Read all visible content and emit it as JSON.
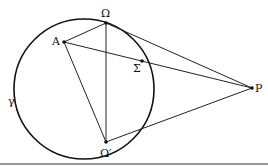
{
  "diagram": {
    "circle": {
      "label": "γ",
      "cx": 84,
      "cy": 89,
      "r": 70
    },
    "points": {
      "A": {
        "label": "A",
        "x": 64,
        "y": 42
      },
      "Omega": {
        "label": "Ω",
        "x": 106,
        "y": 23
      },
      "Sigma": {
        "label": "Σ",
        "x": 142,
        "y": 61
      },
      "OmegaPrime": {
        "label": "Ω′",
        "x": 106,
        "y": 142
      },
      "P": {
        "label": "P",
        "x": 252,
        "y": 88
      }
    },
    "segments": [
      [
        "A",
        "Omega"
      ],
      [
        "A",
        "P"
      ],
      [
        "A",
        "OmegaPrime"
      ],
      [
        "Omega",
        "OmegaPrime"
      ],
      [
        "Omega",
        "P"
      ],
      [
        "OmegaPrime",
        "P"
      ]
    ],
    "colors": {
      "stroke": "#111111",
      "background": "#ffffff"
    }
  }
}
